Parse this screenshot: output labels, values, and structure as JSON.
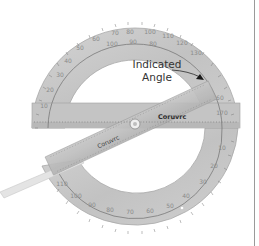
{
  "figure": {
    "annotation": {
      "line1": "Indicated",
      "line2": "Angle"
    },
    "brand_text": "Coruvrc",
    "upper_scale_outer": [
      "10",
      "20",
      "30",
      "40",
      "50",
      "60",
      "70",
      "80",
      "90",
      "100",
      "110",
      "120",
      "130",
      "140",
      "150",
      "160",
      "170"
    ],
    "upper_scale_inner": [
      "170",
      "160",
      "150",
      "140",
      "130",
      "120",
      "110",
      "100",
      "90",
      "80",
      "70",
      "60",
      "50",
      "40",
      "30",
      "20",
      "10"
    ],
    "lower_scale_outer": [
      "10",
      "20",
      "30",
      "40",
      "50",
      "60",
      "70",
      "80",
      "90",
      "100",
      "110",
      "120",
      "130",
      "140",
      "150",
      "160",
      "170"
    ],
    "colors": {
      "background": "#ffffff",
      "protractor_body": "#c9c9c9",
      "protractor_edge": "#a8a8a8",
      "ticks": "#6e6e6e",
      "arrow": "#1a1a1a",
      "label": "#333333",
      "edge_line": "#9a9a9a"
    }
  }
}
